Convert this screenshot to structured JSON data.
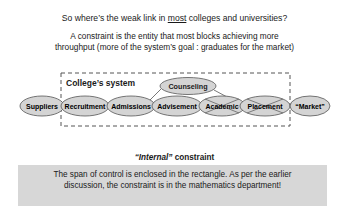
{
  "heading": {
    "prefix": "So where’s the weak link in ",
    "underlined": "most",
    "suffix": " colleges and universities?"
  },
  "definition": {
    "line1": "A constraint is the entity that most blocks achieving more",
    "line2": "throughput (more of the system’s goal : graduates for the market)"
  },
  "diagram": {
    "boundary_label": "College’s system",
    "nodes": [
      {
        "id": "suppliers",
        "label": "Suppliers",
        "crossed": false
      },
      {
        "id": "recruitment",
        "label": "Recruitment",
        "crossed": false
      },
      {
        "id": "admissions",
        "label": "Admissions",
        "crossed": false
      },
      {
        "id": "advisement",
        "label": "Advisement",
        "crossed": false
      },
      {
        "id": "academic",
        "label": "Academic",
        "crossed": true
      },
      {
        "id": "placement",
        "label": "Placement",
        "crossed": true
      },
      {
        "id": "market",
        "label": "“Market”",
        "crossed": false
      }
    ],
    "branch_node": {
      "id": "counseling",
      "label": "Counseling"
    },
    "colors": {
      "ellipse_fill": "#d4d4d4",
      "ellipse_stroke": "#555555",
      "boundary": "#555555"
    }
  },
  "constraint_label": {
    "quoted": "“Internal”",
    "rest": " constraint"
  },
  "note": {
    "line1": "The span of control is enclosed in the rectangle. As per the earlier",
    "line2": "discussion, the constraint is in the mathematics department!"
  }
}
